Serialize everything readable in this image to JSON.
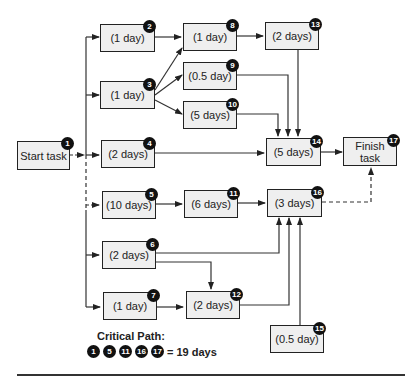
{
  "tasks": [
    {
      "id": "1",
      "label": "Start task"
    },
    {
      "id": "2",
      "label": "(1 day)"
    },
    {
      "id": "3",
      "label": "(1 day)"
    },
    {
      "id": "4",
      "label": "(2 days)"
    },
    {
      "id": "5",
      "label": "(10 days)"
    },
    {
      "id": "6",
      "label": "(2 days)"
    },
    {
      "id": "7",
      "label": "(1 day)"
    },
    {
      "id": "8",
      "label": "(1 day)"
    },
    {
      "id": "9",
      "label": "(0.5 day)"
    },
    {
      "id": "10",
      "label": "(5 days)"
    },
    {
      "id": "11",
      "label": "(6 days)"
    },
    {
      "id": "12",
      "label": "(2 days)"
    },
    {
      "id": "13",
      "label": "(2 days)"
    },
    {
      "id": "14",
      "label": "(5 days)"
    },
    {
      "id": "15",
      "label": "(0.5 day)"
    },
    {
      "id": "16",
      "label": "(3 days)"
    },
    {
      "id": "17",
      "label": "Finish task"
    }
  ],
  "edges": [
    {
      "from": "1",
      "to": "2"
    },
    {
      "from": "1",
      "to": "3"
    },
    {
      "from": "1",
      "to": "4"
    },
    {
      "from": "1",
      "to": "5",
      "style": "dashed"
    },
    {
      "from": "1",
      "to": "6"
    },
    {
      "from": "1",
      "to": "7"
    },
    {
      "from": "2",
      "to": "8"
    },
    {
      "from": "3",
      "to": "8"
    },
    {
      "from": "3",
      "to": "9"
    },
    {
      "from": "3",
      "to": "10"
    },
    {
      "from": "8",
      "to": "13"
    },
    {
      "from": "13",
      "to": "14"
    },
    {
      "from": "9",
      "to": "14"
    },
    {
      "from": "10",
      "to": "14"
    },
    {
      "from": "4",
      "to": "14"
    },
    {
      "from": "14",
      "to": "17"
    },
    {
      "from": "5",
      "to": "11"
    },
    {
      "from": "11",
      "to": "16"
    },
    {
      "from": "6",
      "to": "16"
    },
    {
      "from": "6",
      "to": "12"
    },
    {
      "from": "7",
      "to": "12"
    },
    {
      "from": "12",
      "to": "16"
    },
    {
      "from": "15",
      "to": "16"
    },
    {
      "from": "16",
      "to": "17",
      "style": "dashed"
    }
  ],
  "critical_path": {
    "title": "Critical Path:",
    "nodes": [
      "1",
      "5",
      "11",
      "16",
      "17"
    ],
    "total": "= 19 days"
  }
}
